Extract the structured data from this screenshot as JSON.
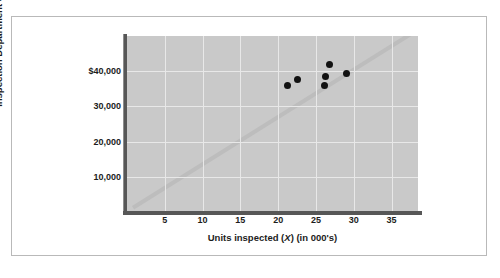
{
  "chart_data": {
    "type": "scatter",
    "title": "",
    "xlabel": "Units inspected (X) (in 000's)",
    "xlabel_parts": {
      "pre": "Units inspected (",
      "var": "X",
      "post": ") (in 000's)"
    },
    "ylabel": "Inspection Department costs (Y)",
    "ylabel_parts": {
      "pre": "Inspection Department costs (",
      "var": "Y",
      "post": ")"
    },
    "xlim": [
      0,
      38.5
    ],
    "ylim": [
      0,
      50000
    ],
    "grid": true,
    "legend": null,
    "xticks": [
      5,
      10,
      15,
      20,
      25,
      30,
      35
    ],
    "xtick_labels": [
      "5",
      "10",
      "15",
      "20",
      "25",
      "30",
      "35"
    ],
    "yticks": [
      10000,
      20000,
      30000,
      40000
    ],
    "ytick_labels": [
      "10,000",
      "20,000",
      "30,000",
      "$40,000"
    ],
    "points": [
      {
        "x": 21.3,
        "y": 35800
      },
      {
        "x": 22.6,
        "y": 37600
      },
      {
        "x": 26.1,
        "y": 35900
      },
      {
        "x": 26.3,
        "y": 38600
      },
      {
        "x": 26.8,
        "y": 42000
      },
      {
        "x": 29.1,
        "y": 39400
      }
    ],
    "trendline": {
      "name": "regression-line",
      "x0": 0.8,
      "y0": 1200,
      "x1": 37.5,
      "y1": 50500
    },
    "colors": {
      "plot_background": "#c9c9c9",
      "gridline": "#e8e8e8",
      "point": "#121212",
      "trendline": "#bdbdbd",
      "axis": "#575757",
      "frame": "#b9b9b9",
      "text": "#1c1c1c"
    }
  }
}
